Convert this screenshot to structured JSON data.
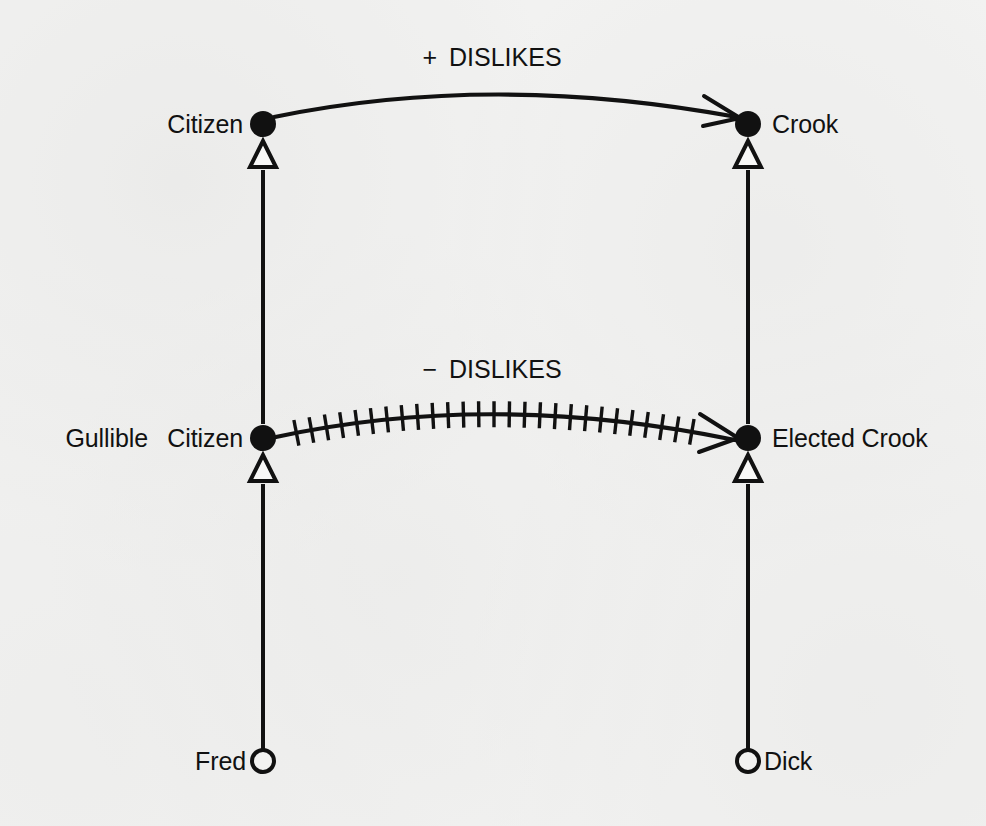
{
  "diagram": {
    "type": "semantic-network",
    "background_color": "#f2f2f1",
    "ink_color": "#111111",
    "nodes": [
      {
        "id": "citizen",
        "label": "Citizen",
        "shape": "filled-circle",
        "x": 263,
        "y": 124,
        "r": 13,
        "label_side": "left"
      },
      {
        "id": "crook",
        "label": "Crook",
        "shape": "filled-circle",
        "x": 748,
        "y": 124,
        "r": 13,
        "label_side": "right"
      },
      {
        "id": "gullible",
        "label": "Gullible",
        "shape": "text-only",
        "x": 148,
        "y": 438,
        "r": 0,
        "label_side": "left"
      },
      {
        "id": "gullible_citizen",
        "label": "Citizen",
        "shape": "filled-circle",
        "x": 263,
        "y": 438,
        "r": 13,
        "label_side": "left"
      },
      {
        "id": "elected_crook",
        "label": "Elected Crook",
        "shape": "filled-circle",
        "x": 748,
        "y": 438,
        "r": 13,
        "label_side": "right"
      },
      {
        "id": "fred",
        "label": "Fred",
        "shape": "open-circle",
        "x": 263,
        "y": 761,
        "r": 11,
        "label_side": "left"
      },
      {
        "id": "dick",
        "label": "Dick",
        "shape": "open-circle",
        "x": 748,
        "y": 761,
        "r": 11,
        "label_side": "right"
      }
    ],
    "relations": [
      {
        "id": "dislikes_positive",
        "sign": "+",
        "name": "DISLIKES",
        "from": "citizen",
        "to": "crook",
        "style": "arc",
        "negated": false,
        "label_x": 492,
        "label_y": 57,
        "arc_apex_y": 92
      },
      {
        "id": "dislikes_negative",
        "sign": "−",
        "name": "DISLIKES",
        "from": "gullible_citizen",
        "to": "elected_crook",
        "style": "arc-hatched",
        "negated": true,
        "hatch_count": 27,
        "label_x": 492,
        "label_y": 369,
        "arc_apex_y": 409
      }
    ],
    "isa_links": [
      {
        "id": "isa_gullible_citizen",
        "from": "gullible_citizen",
        "to": "citizen",
        "arrowhead": "hollow-triangle",
        "direction": "up"
      },
      {
        "id": "isa_elected_crook",
        "from": "elected_crook",
        "to": "crook",
        "arrowhead": "hollow-triangle",
        "direction": "up"
      },
      {
        "id": "isa_fred",
        "from": "fred",
        "to": "gullible_citizen",
        "arrowhead": "hollow-triangle",
        "direction": "up"
      },
      {
        "id": "isa_dick",
        "from": "dick",
        "to": "elected_crook",
        "arrowhead": "hollow-triangle",
        "direction": "up"
      }
    ]
  }
}
